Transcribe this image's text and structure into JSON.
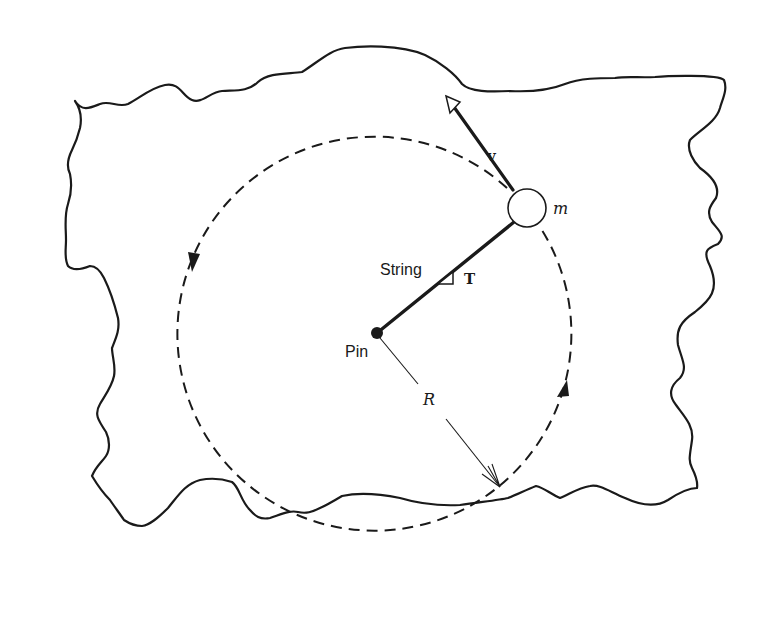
{
  "figure": {
    "labels": {
      "velocity": "v",
      "mass": "m",
      "string": "String",
      "tension": "T",
      "pin": "Pin",
      "radius": "R"
    },
    "colors": {
      "ink": "#1a1a1a",
      "background": "#ffffff"
    },
    "geometry": {
      "pin_center": [
        377,
        333
      ],
      "orbit_radius_px": 197,
      "mass_center": [
        527,
        208
      ],
      "mass_radius_px": 19,
      "orbit_direction": "counterclockwise"
    }
  }
}
